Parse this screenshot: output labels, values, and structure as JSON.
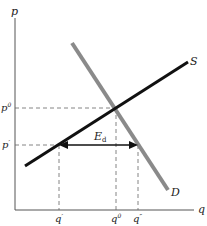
{
  "diagram": {
    "type": "supply-demand",
    "axes": {
      "y_label": "p",
      "x_label": "q"
    },
    "curves": {
      "supply": {
        "label": "S",
        "color": "#111111"
      },
      "demand": {
        "label": "D",
        "color": "#8a8a8a"
      }
    },
    "price_levels": {
      "equilibrium": {
        "label": "p",
        "sup": "0"
      },
      "controlled": {
        "label": "p",
        "sup": "′"
      }
    },
    "quantity_levels": {
      "q_supplied": {
        "label": "q",
        "sup": "′"
      },
      "equilibrium": {
        "label": "q",
        "sup": "0"
      },
      "q_demanded": {
        "label": "q",
        "sup": "″"
      }
    },
    "excess_demand": {
      "label": "E",
      "sub": "d"
    }
  }
}
